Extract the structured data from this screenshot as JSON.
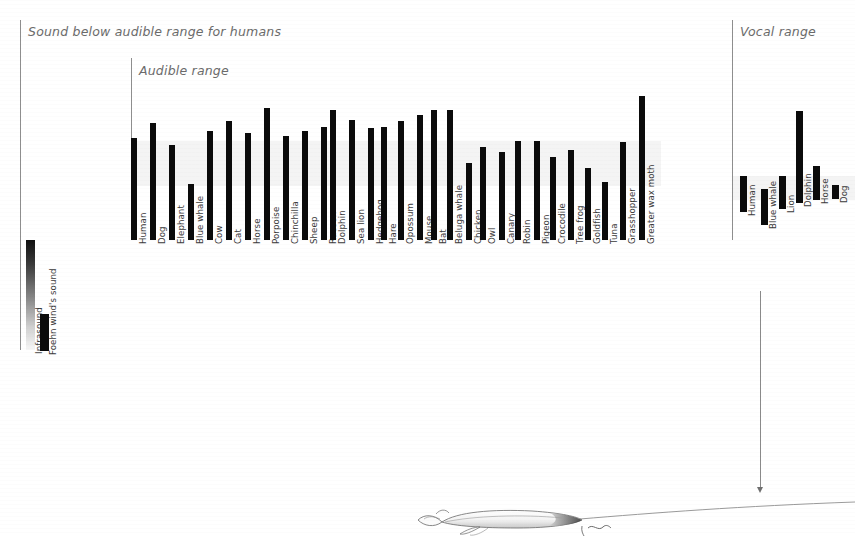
{
  "figure": {
    "background_color": "#ffffff",
    "bar_color": "#0b0b0b",
    "band_color": "#efefef",
    "rule_color": "#8e8e8e",
    "label_color": "#3a3a3a",
    "title_color": "#6b6b6b"
  },
  "panels": {
    "infrasound": {
      "title": "Sound below audible range for humans",
      "bars": [
        {
          "label": "Infrasound",
          "style": "gradient"
        },
        {
          "label": "Foehn wind's sound",
          "style": "solid"
        }
      ]
    },
    "audible": {
      "title": "Audible range"
    },
    "vocal": {
      "title": "Vocal range"
    }
  },
  "annotation": {
    "target_label": "Blue whale",
    "illustration": "blue-whale-drawing"
  },
  "chart_data": [
    {
      "type": "bar",
      "title": "Sound below audible range for humans",
      "orientation": "vertical-range-bars",
      "note": "Range bars drawn downward from a high-frequency top to a low-frequency bottom. Values given as pixel-space top/bottom of each bar in the source figure.",
      "xlabel": "",
      "ylabel": "Frequency (log scale, low at bottom)",
      "grid": false,
      "legend": false,
      "categories": [
        "Infrasound",
        "Foehn wind's sound"
      ],
      "bars": [
        {
          "label": "Infrasound",
          "top": 240,
          "bottom": 350,
          "fade": true
        },
        {
          "label": "Foehn wind's sound",
          "top": 314,
          "bottom": 351,
          "fade": false
        }
      ]
    },
    {
      "type": "bar",
      "title": "Audible range",
      "orientation": "vertical-range-bars",
      "xlabel": "",
      "ylabel": "Frequency (log scale, low at bottom)",
      "grid": false,
      "legend": false,
      "band": {
        "top": 141,
        "bottom": 186,
        "label": "human audible band"
      },
      "categories": [
        "Human",
        "Dog",
        "Elephant",
        "Blue whale",
        "Cow",
        "Cat",
        "Horse",
        "Porpoise",
        "Chinchilla",
        "Sheep",
        "Racoon",
        "Dolphin",
        "Sea lion",
        "Hedgehog",
        "Hare",
        "Opossum",
        "Mouse",
        "Bat",
        "Beluga whale",
        "Chicken",
        "Owl",
        "Canary",
        "Robin",
        "Pigeon",
        "Crocodile",
        "Tree frog",
        "Goldfish",
        "Tuna",
        "Grasshopper",
        "Greater wax moth"
      ],
      "bars": [
        {
          "label": "Human",
          "x": 131,
          "top": 138,
          "bottom": 240
        },
        {
          "label": "Dog",
          "x": 150,
          "top": 123,
          "bottom": 240
        },
        {
          "label": "Elephant",
          "x": 169,
          "top": 145,
          "bottom": 240
        },
        {
          "label": "Blue whale",
          "x": 188,
          "top": 184,
          "bottom": 240
        },
        {
          "label": "Cow",
          "x": 207,
          "top": 131,
          "bottom": 240
        },
        {
          "label": "Cat",
          "x": 226,
          "top": 121,
          "bottom": 240
        },
        {
          "label": "Horse",
          "x": 245,
          "top": 133,
          "bottom": 240
        },
        {
          "label": "Porpoise",
          "x": 264,
          "top": 108,
          "bottom": 240
        },
        {
          "label": "Chinchilla",
          "x": 283,
          "top": 136,
          "bottom": 240
        },
        {
          "label": "Sheep",
          "x": 302,
          "top": 131,
          "bottom": 240
        },
        {
          "label": "Racoon",
          "x": 321,
          "top": 127,
          "bottom": 240
        },
        {
          "label": "Dolphin",
          "x": 330,
          "top": 110,
          "bottom": 240
        },
        {
          "label": "Sea lion",
          "x": 349,
          "top": 120,
          "bottom": 240
        },
        {
          "label": "Hedgehog",
          "x": 368,
          "top": 128,
          "bottom": 240
        },
        {
          "label": "Hare",
          "x": 381,
          "top": 127,
          "bottom": 240
        },
        {
          "label": "Opossum",
          "x": 398,
          "top": 121,
          "bottom": 240
        },
        {
          "label": "Mouse",
          "x": 417,
          "top": 115,
          "bottom": 240
        },
        {
          "label": "Bat",
          "x": 431,
          "top": 110,
          "bottom": 240
        },
        {
          "label": "Beluga whale",
          "x": 447,
          "top": 110,
          "bottom": 240
        },
        {
          "label": "Chicken",
          "x": 466,
          "top": 163,
          "bottom": 240
        },
        {
          "label": "Owl",
          "x": 480,
          "top": 147,
          "bottom": 240
        },
        {
          "label": "Canary",
          "x": 499,
          "top": 152,
          "bottom": 240
        },
        {
          "label": "Robin",
          "x": 515,
          "top": 141,
          "bottom": 240
        },
        {
          "label": "Pigeon",
          "x": 534,
          "top": 141,
          "bottom": 240
        },
        {
          "label": "Crocodile",
          "x": 550,
          "top": 157,
          "bottom": 240
        },
        {
          "label": "Tree frog",
          "x": 568,
          "top": 150,
          "bottom": 240
        },
        {
          "label": "Goldfish",
          "x": 585,
          "top": 168,
          "bottom": 240
        },
        {
          "label": "Tuna",
          "x": 602,
          "top": 182,
          "bottom": 240
        },
        {
          "label": "Grasshopper",
          "x": 620,
          "top": 142,
          "bottom": 240
        },
        {
          "label": "Greater wax moth",
          "x": 639,
          "top": 96,
          "bottom": 240
        }
      ]
    },
    {
      "type": "bar",
      "title": "Vocal range",
      "orientation": "vertical-range-bars",
      "xlabel": "",
      "ylabel": "Frequency (log scale, low at bottom)",
      "grid": false,
      "legend": false,
      "band": {
        "top": 176,
        "bottom": 200,
        "label": "human vocal band"
      },
      "categories": [
        "Human",
        "Blue whale",
        "Lion",
        "Dolphin",
        "Horse",
        "Dog"
      ],
      "bars": [
        {
          "label": "Human",
          "x": 740,
          "top": 176,
          "bottom": 212
        },
        {
          "label": "Blue whale",
          "x": 761,
          "top": 189,
          "bottom": 225
        },
        {
          "label": "Lion",
          "x": 779,
          "top": 176,
          "bottom": 209
        },
        {
          "label": "Dolphin",
          "x": 796,
          "top": 111,
          "bottom": 203
        },
        {
          "label": "Horse",
          "x": 813,
          "top": 166,
          "bottom": 200
        },
        {
          "label": "Dog",
          "x": 832,
          "top": 185,
          "bottom": 199
        }
      ]
    }
  ]
}
